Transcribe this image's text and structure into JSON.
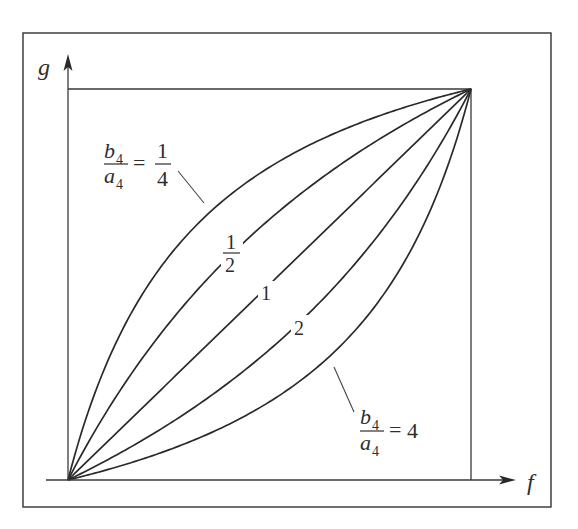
{
  "figure": {
    "frame": {
      "x": 23,
      "y": 33,
      "width": 528,
      "height": 474
    },
    "plot_box": {
      "origin_x": 68,
      "origin_y": 480,
      "right_x": 471,
      "top_y": 89
    },
    "axes": {
      "x_label": "f",
      "y_label": "g",
      "x_axis_start": 46,
      "x_arrow_tip": 515,
      "y_arrow_tip": 55
    },
    "colors": {
      "line": "#2a2a2a",
      "frame": "#333333",
      "background": "#ffffff"
    }
  },
  "chart_data": {
    "type": "line",
    "title": "",
    "xlabel": "f",
    "ylabel": "g",
    "xlim": [
      0,
      1
    ],
    "ylim": [
      0,
      1
    ],
    "grid": false,
    "legend": "inline curve labels",
    "formula": "g = f / (f + r (1 - f)), r = b4/a4",
    "parameter_name": "b4/a4",
    "series": [
      {
        "name": "b4/a4 = 1/4",
        "r": 0.25,
        "label": "1/4",
        "x": [
          0,
          0.1,
          0.2,
          0.3,
          0.4,
          0.5,
          0.6,
          0.7,
          0.8,
          0.9,
          1
        ],
        "values": [
          0,
          0.308,
          0.5,
          0.632,
          0.727,
          0.8,
          0.857,
          0.903,
          0.941,
          0.973,
          1
        ]
      },
      {
        "name": "b4/a4 = 1/2",
        "r": 0.5,
        "label": "1/2",
        "x": [
          0,
          0.1,
          0.2,
          0.3,
          0.4,
          0.5,
          0.6,
          0.7,
          0.8,
          0.9,
          1
        ],
        "values": [
          0,
          0.182,
          0.333,
          0.462,
          0.571,
          0.667,
          0.75,
          0.824,
          0.889,
          0.947,
          1
        ]
      },
      {
        "name": "b4/a4 = 1",
        "r": 1,
        "label": "1",
        "x": [
          0,
          0.1,
          0.2,
          0.3,
          0.4,
          0.5,
          0.6,
          0.7,
          0.8,
          0.9,
          1
        ],
        "values": [
          0,
          0.1,
          0.2,
          0.3,
          0.4,
          0.5,
          0.6,
          0.7,
          0.8,
          0.9,
          1
        ]
      },
      {
        "name": "b4/a4 = 2",
        "r": 2,
        "label": "2",
        "x": [
          0,
          0.1,
          0.2,
          0.3,
          0.4,
          0.5,
          0.6,
          0.7,
          0.8,
          0.9,
          1
        ],
        "values": [
          0,
          0.053,
          0.111,
          0.176,
          0.25,
          0.333,
          0.429,
          0.538,
          0.667,
          0.818,
          1
        ]
      },
      {
        "name": "b4/a4 = 4",
        "r": 4,
        "label": "4",
        "x": [
          0,
          0.1,
          0.2,
          0.3,
          0.4,
          0.5,
          0.6,
          0.7,
          0.8,
          0.9,
          1
        ],
        "values": [
          0,
          0.027,
          0.059,
          0.097,
          0.143,
          0.2,
          0.273,
          0.368,
          0.5,
          0.692,
          1
        ]
      }
    ],
    "annotations": [
      {
        "text": "b4/a4 = 1/4",
        "target_series": "b4/a4 = 1/4",
        "with_leader_line": true
      },
      {
        "text": "1/2",
        "target_series": "b4/a4 = 1/2",
        "inline": true
      },
      {
        "text": "1",
        "target_series": "b4/a4 = 1",
        "inline": true
      },
      {
        "text": "2",
        "target_series": "b4/a4 = 2",
        "inline": true
      },
      {
        "text": "b4/a4 = 4",
        "target_series": "b4/a4 = 4",
        "with_leader_line": true
      }
    ]
  },
  "labels": {
    "top_ratio": {
      "num": "b",
      "num_sub": "4",
      "den": "a",
      "den_sub": "4",
      "eq": "=",
      "val_num": "1",
      "val_den": "4"
    },
    "bottom_ratio": {
      "num": "b",
      "num_sub": "4",
      "den": "a",
      "den_sub": "4",
      "eq": "=",
      "val": "4"
    },
    "half": {
      "num": "1",
      "den": "2"
    },
    "one": "1",
    "two": "2"
  }
}
